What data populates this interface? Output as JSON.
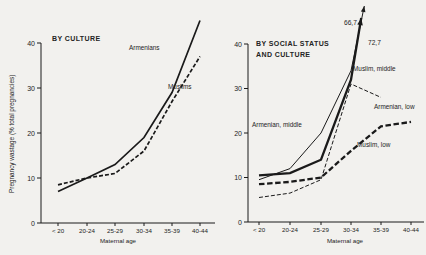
{
  "figure": {
    "y_axis_title": "Pregnancy wastage (% total pregnancies)",
    "x_axis_title": "Maternal age",
    "ink_color": "#1a1a1a",
    "paper_color": "#f2f1ee"
  },
  "chart_data": [
    {
      "type": "line",
      "panel": "left",
      "title_lines": [
        "BY CULTURE"
      ],
      "xlabel": "Maternal age",
      "ylabel": "Pregnancy wastage (% total pregnancies)",
      "categories": [
        "< 20",
        "20-24",
        "25-29",
        "30-34",
        "35-39",
        "40-44"
      ],
      "y_ticks": [
        0,
        10,
        20,
        30,
        40
      ],
      "ylim": [
        0,
        40
      ],
      "grid": false,
      "legend_position": "inline-labels",
      "series": [
        {
          "name": "Armenians",
          "style": "solid",
          "weight": "medium",
          "values": [
            7,
            10,
            13,
            19,
            29,
            45
          ]
        },
        {
          "name": "Muslims",
          "style": "dashed",
          "weight": "medium",
          "values": [
            8.5,
            10,
            11,
            16,
            27,
            37
          ]
        }
      ]
    },
    {
      "type": "line",
      "panel": "right",
      "title_lines": [
        "BY SOCIAL STATUS",
        "AND CULTURE"
      ],
      "xlabel": "Maternal age",
      "ylabel": "Pregnancy wastage (% total pregnancies)",
      "categories": [
        "< 20",
        "20-24",
        "25-29",
        "30-34",
        "35-39",
        "40-44"
      ],
      "y_ticks": [
        0,
        10,
        20,
        30,
        40
      ],
      "ylim": [
        0,
        40
      ],
      "grid": false,
      "legend_position": "inline-labels",
      "series": [
        {
          "name": "Muslim, middle",
          "style": "solid",
          "weight": "thick",
          "values": [
            10.5,
            11,
            14,
            32,
            72.7,
            null
          ],
          "offscale": true,
          "annotation": "72,7"
        },
        {
          "name": "Armenian, middle",
          "style": "solid",
          "weight": "thin",
          "values": [
            9.5,
            12,
            20,
            34,
            66.7,
            null
          ],
          "offscale": true,
          "annotation": "66,7"
        },
        {
          "name": "Armenian, low",
          "style": "dashed",
          "weight": "thin",
          "values": [
            5.5,
            6.5,
            9.5,
            31,
            28,
            null
          ]
        },
        {
          "name": "Muslim, low",
          "style": "dashed",
          "weight": "thick",
          "values": [
            8.5,
            9,
            10,
            16,
            21.5,
            22.5
          ]
        }
      ],
      "annotations": [
        {
          "text": "66,7",
          "series": "Armenian, middle"
        },
        {
          "text": "72,7",
          "series": "Muslim, middle"
        }
      ]
    }
  ]
}
